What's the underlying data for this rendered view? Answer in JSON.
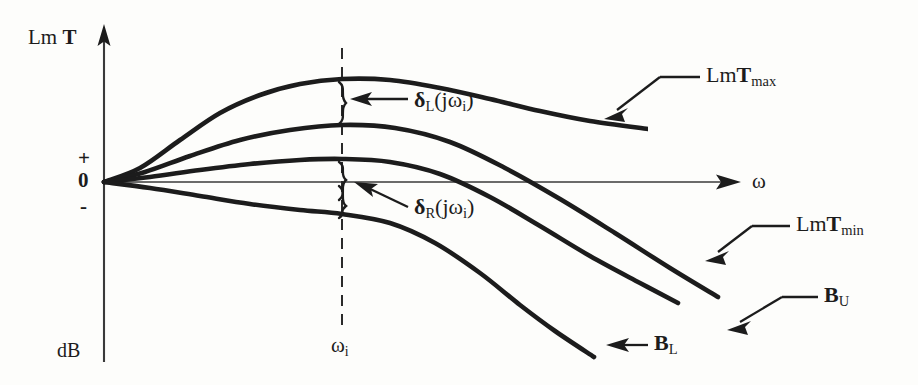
{
  "figure": {
    "type": "engineering-diagram",
    "background_color": "#fdfdfb",
    "ink_color": "#1c1c1c"
  },
  "axes": {
    "y_axis": {
      "title_prefix": "Lm ",
      "title_symbol": "T",
      "unit_label": "dB",
      "ticks": [
        {
          "label": "+",
          "name": "plus"
        },
        {
          "label": "0",
          "name": "zero"
        },
        {
          "label": "-",
          "name": "minus"
        }
      ]
    },
    "x_axis": {
      "label": "ω",
      "marker_label_prefix": "ω",
      "marker_label_sub": "i"
    }
  },
  "curves": [
    {
      "id": "lm-t-max",
      "label_prefix": "Lm",
      "label_symbol": "T",
      "label_sub": "max",
      "full_label": "LmTmax"
    },
    {
      "id": "b-u",
      "label_prefix": "",
      "label_symbol": "B",
      "label_sub": "U",
      "full_label": "BU"
    },
    {
      "id": "lm-t-min",
      "label_prefix": "Lm",
      "label_symbol": "T",
      "label_sub": "min",
      "full_label": "LmTmin"
    },
    {
      "id": "b-l",
      "label_prefix": "",
      "label_symbol": "B",
      "label_sub": "L",
      "full_label": "BL"
    }
  ],
  "annotations": [
    {
      "id": "delta-left",
      "symbol": "δ",
      "sub": "L",
      "arg": "(jω",
      "arg_sub": "i",
      "arg_close": ")",
      "full_label": "δL(jωi)"
    },
    {
      "id": "delta-right",
      "symbol": "δ",
      "sub": "R",
      "arg": "(jω",
      "arg_sub": "i",
      "arg_close": ")",
      "full_label": "δR(jωi)"
    }
  ],
  "chart_data": {
    "type": "line",
    "title": "",
    "xlabel": "ω",
    "ylabel": "Lm T",
    "yunit": "dB",
    "grid": false,
    "legend": "inline-leader-labels",
    "x_marker": {
      "label": "ωi",
      "pixel_x": 342
    },
    "origin_px": {
      "x": 104,
      "y": 182
    },
    "series": [
      {
        "name": "LmTmax",
        "points_px": [
          [
            104,
            182
          ],
          [
            140,
            168
          ],
          [
            180,
            140
          ],
          [
            220,
            113
          ],
          [
            260,
            95
          ],
          [
            300,
            84
          ],
          [
            342,
            79
          ],
          [
            390,
            80
          ],
          [
            440,
            88
          ],
          [
            490,
            99
          ],
          [
            540,
            111
          ],
          [
            590,
            121
          ],
          [
            648,
            129
          ]
        ]
      },
      {
        "name": "BU",
        "points_px": [
          [
            104,
            182
          ],
          [
            145,
            172
          ],
          [
            190,
            156
          ],
          [
            240,
            140
          ],
          [
            290,
            130
          ],
          [
            342,
            125
          ],
          [
            395,
            128
          ],
          [
            450,
            142
          ],
          [
            505,
            168
          ],
          [
            560,
            199
          ],
          [
            615,
            233
          ],
          [
            670,
            268
          ],
          [
            718,
            297
          ]
        ]
      },
      {
        "name": "LmTmin",
        "points_px": [
          [
            104,
            182
          ],
          [
            150,
            177
          ],
          [
            200,
            170
          ],
          [
            250,
            164
          ],
          [
            300,
            160
          ],
          [
            342,
            159
          ],
          [
            390,
            162
          ],
          [
            440,
            174
          ],
          [
            490,
            197
          ],
          [
            540,
            226
          ],
          [
            590,
            256
          ],
          [
            640,
            283
          ],
          [
            678,
            303
          ]
        ]
      },
      {
        "name": "BL",
        "points_px": [
          [
            104,
            182
          ],
          [
            150,
            188
          ],
          [
            200,
            196
          ],
          [
            250,
            204
          ],
          [
            300,
            210
          ],
          [
            342,
            214
          ],
          [
            390,
            223
          ],
          [
            435,
            243
          ],
          [
            480,
            273
          ],
          [
            520,
            305
          ],
          [
            555,
            331
          ],
          [
            594,
            357
          ]
        ]
      }
    ]
  }
}
